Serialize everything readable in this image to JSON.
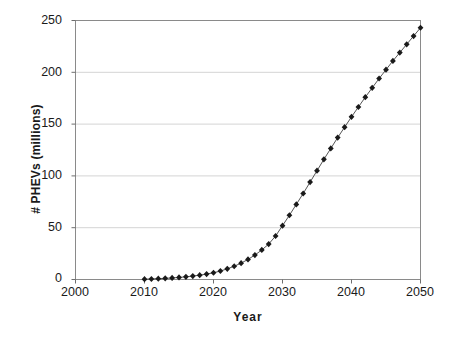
{
  "chart_data": {
    "type": "line",
    "title": "",
    "xlabel": "Year",
    "ylabel": "# PHEVs (millions)",
    "xlim": [
      2000,
      2050
    ],
    "ylim": [
      0,
      250
    ],
    "xticks": [
      2000,
      2010,
      2020,
      2030,
      2040,
      2050
    ],
    "yticks": [
      0,
      50,
      100,
      150,
      200,
      250
    ],
    "grid": "horizontal",
    "legend": "none",
    "marker": "diamond",
    "marker_color": "#1a1a1a",
    "line_color": "#555555",
    "series": [
      {
        "name": "# PHEVs (millions)",
        "x": [
          2010,
          2011,
          2012,
          2013,
          2014,
          2015,
          2016,
          2017,
          2018,
          2019,
          2020,
          2021,
          2022,
          2023,
          2024,
          2025,
          2026,
          2027,
          2028,
          2029,
          2030,
          2031,
          2032,
          2033,
          2034,
          2035,
          2036,
          2037,
          2038,
          2039,
          2040,
          2041,
          2042,
          2043,
          2044,
          2045,
          2046,
          2047,
          2048,
          2049,
          2050
        ],
        "values": [
          0.3,
          0.5,
          0.8,
          1.1,
          1.5,
          2.0,
          2.6,
          3.3,
          4.2,
          5.2,
          6.5,
          8.2,
          10.3,
          12.8,
          15.8,
          19.4,
          23.6,
          28.5,
          34.2,
          42.0,
          52.0,
          62.0,
          72.5,
          83.0,
          94.0,
          105.0,
          116.0,
          126.5,
          137.0,
          147.0,
          157.0,
          166.5,
          176.0,
          185.0,
          194.0,
          202.5,
          211.0,
          219.0,
          227.0,
          235.0,
          243.0
        ]
      }
    ]
  },
  "axis": {
    "ytick_labels": [
      "250",
      "200",
      "150",
      "100",
      "50",
      "0"
    ],
    "xtick_labels": [
      "2000",
      "2010",
      "2020",
      "2030",
      "2040",
      "2050"
    ]
  }
}
